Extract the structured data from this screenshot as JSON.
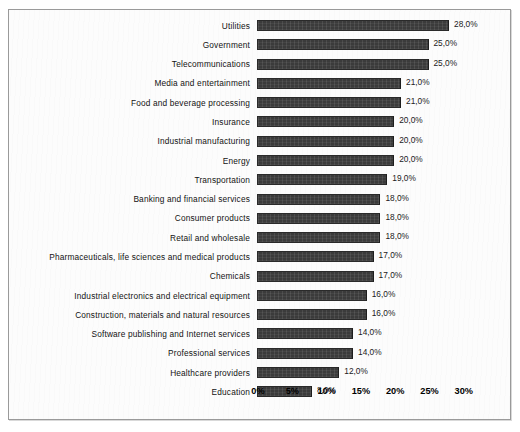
{
  "chart_data": {
    "type": "bar",
    "orientation": "horizontal",
    "title": "",
    "subtitle": "",
    "xlabel": "",
    "ylabel": "",
    "grid": false,
    "legend": null,
    "xlim": [
      0,
      30
    ],
    "xtick_labels": [
      "0%",
      "5%",
      "10%",
      "15%",
      "20%",
      "25%",
      "30%"
    ],
    "xtick_values": [
      0,
      5,
      10,
      15,
      20,
      25,
      30
    ],
    "decimal_separator": ",",
    "bar_color": "#3b3b3b",
    "categories": [
      "Utilities",
      "Government",
      "Telecommunications",
      "Media and entertainment",
      "Food and beverage processing",
      "Insurance",
      "Industrial manufacturing",
      "Energy",
      "Transportation",
      "Banking and financial services",
      "Consumer products",
      "Retail and wholesale",
      "Pharmaceuticals, life sciences and medical products",
      "Chemicals",
      "Industrial electronics and electrical equipment",
      "Construction, materials and natural resources",
      "Software publishing and Internet services",
      "Professional services",
      "Healthcare providers",
      "Education"
    ],
    "values": [
      28,
      25,
      25,
      21,
      21,
      20,
      20,
      20,
      19,
      18,
      18,
      18,
      17,
      17,
      16,
      16,
      14,
      14,
      12,
      8
    ],
    "data_labels": [
      "28,0%",
      "25,0%",
      "25,0%",
      "21,0%",
      "21,0%",
      "20,0%",
      "20,0%",
      "20,0%",
      "19,0%",
      "18,0%",
      "18,0%",
      "18,0%",
      "17,0%",
      "17,0%",
      "16,0%",
      "16,0%",
      "14,0%",
      "14,0%",
      "12,0%",
      "8,0%"
    ]
  }
}
